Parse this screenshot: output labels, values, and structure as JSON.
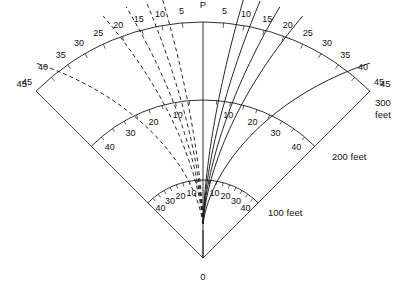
{
  "figure": {
    "title": "",
    "type": "polar-sector-ray-diagram",
    "background": "#ffffff",
    "line_color": "#1a1a1a",
    "apex_label": "0",
    "axis_label": "P"
  },
  "geometry": {
    "apex_x": 203,
    "apex_y": 258,
    "angle_min_deg": -45,
    "angle_max_deg": 45,
    "arc_radii_px": [
      78,
      158,
      236
    ],
    "tick_step_outer_deg": 5,
    "tick_step_inner_deg": 5
  },
  "arcs": [
    {
      "name": "inner",
      "radius_px": 78,
      "label": "100 feet",
      "label_x": 268,
      "label_y": 216
    },
    {
      "name": "middle",
      "radius_px": 158,
      "label": "200 feet",
      "label_x": 332,
      "label_y": 160
    },
    {
      "name": "outer",
      "radius_px": 236,
      "label": "300",
      "label2": "feet",
      "label_x": 375,
      "label_y": 106
    }
  ],
  "outer_arc_labels": {
    "center": "P",
    "values": [
      5,
      10,
      15,
      20,
      25,
      30,
      35,
      40,
      45
    ]
  },
  "middle_arc_labels": {
    "values": [
      10,
      20,
      30,
      40
    ]
  },
  "inner_arc_labels": {
    "values": [
      10,
      20,
      30,
      40
    ]
  },
  "vertex_labels": {
    "left": "45",
    "right": "45"
  },
  "chart_data": {
    "type": "line",
    "title": "",
    "xlabel": "",
    "ylabel": "",
    "radial_unit": "feet",
    "radial_ticks": [
      100,
      200,
      300
    ],
    "angular_unit": "degrees",
    "angular_ticks": [
      0,
      5,
      10,
      15,
      20,
      25,
      30,
      35,
      40,
      45
    ],
    "series": [
      {
        "name": "ray-10-right",
        "style": "solid",
        "side": "right",
        "terminal_angle_deg": 10
      },
      {
        "name": "ray-14-right",
        "style": "solid",
        "side": "right",
        "terminal_angle_deg": 14
      },
      {
        "name": "ray-19-right",
        "style": "solid",
        "side": "right",
        "terminal_angle_deg": 19
      },
      {
        "name": "ray-25-right",
        "style": "solid",
        "side": "right",
        "terminal_angle_deg": 25
      },
      {
        "name": "ray-45-right",
        "style": "solid",
        "side": "right",
        "terminal_angle_deg": 45
      },
      {
        "name": "ray-10-left",
        "style": "dashed",
        "side": "left",
        "terminal_angle_deg": 10
      },
      {
        "name": "ray-14-left",
        "style": "dashed",
        "side": "left",
        "terminal_angle_deg": 14
      },
      {
        "name": "ray-19-left",
        "style": "dashed",
        "side": "left",
        "terminal_angle_deg": 19
      },
      {
        "name": "ray-25-left",
        "style": "dashed",
        "side": "left",
        "terminal_angle_deg": 25
      },
      {
        "name": "ray-45-left",
        "style": "dashed",
        "side": "left",
        "terminal_angle_deg": 45
      }
    ]
  }
}
